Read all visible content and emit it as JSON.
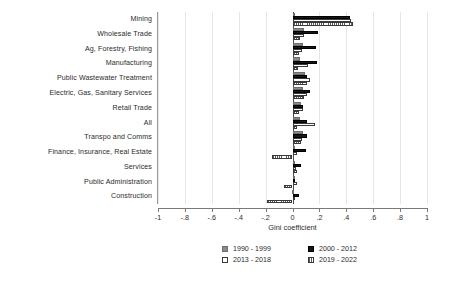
{
  "chart_data": {
    "type": "bar",
    "orientation": "horizontal",
    "title": "",
    "xlabel": "Gini coefficient",
    "ylabel": "",
    "xlim": [
      -1,
      1
    ],
    "grid": true,
    "legend_position": "bottom",
    "xticks": [
      -1,
      -0.8,
      -0.6,
      -0.4,
      -0.2,
      0,
      0.2,
      0.4,
      0.6,
      0.8,
      1
    ],
    "xticklabels": [
      "-1",
      "-.8",
      "-.6",
      "-.4",
      "-.2",
      "0",
      ".2",
      ".4",
      ".6",
      ".8",
      "1"
    ],
    "categories": [
      "Mining",
      "Wholesale Trade",
      "Ag, Forestry, Fishing",
      "Manufacturing",
      "Public Wastewater Treatment",
      "Electric, Gas, Sanitary Services",
      "Retail Trade",
      "All",
      "Transpo and Comms",
      "Finance, Insurance, Real Estate",
      "Services",
      "Public Administration",
      "Construction"
    ],
    "series": [
      {
        "name": "1990 - 1999",
        "color": "#8c8c8c",
        "pattern": "solid-gray",
        "values": [
          0.015,
          0.085,
          0.075,
          0.055,
          0.095,
          0.075,
          0.065,
          0.055,
          0.075,
          0.02,
          0.015,
          0.01,
          -0.005
        ]
      },
      {
        "name": "2000 - 2012",
        "color": "#151515",
        "pattern": "solid-black",
        "values": [
          0.43,
          0.19,
          0.175,
          0.18,
          0.11,
          0.13,
          0.08,
          0.105,
          0.105,
          0.1,
          0.065,
          0.02,
          0.045
        ]
      },
      {
        "name": "2013 - 2018",
        "color": "#ffffff",
        "pattern": "hollow",
        "values": [
          0.435,
          0.085,
          0.07,
          0.115,
          0.13,
          0.11,
          0.075,
          0.165,
          0.07,
          0.035,
          0.025,
          0.035,
          0.02
        ]
      },
      {
        "name": "2019 - 2022",
        "color": "#ffffff",
        "pattern": "hatched",
        "values": [
          0.45,
          0.055,
          0.045,
          0.04,
          0.105,
          0.085,
          0.05,
          0.03,
          0.06,
          -0.155,
          0.035,
          -0.06,
          -0.19
        ]
      }
    ]
  },
  "legend": {
    "items": [
      {
        "label": "1990 - 1999",
        "swatch": "gray-swatch"
      },
      {
        "label": "2000 - 2012",
        "swatch": "black-swatch"
      },
      {
        "label": "2013 - 2018",
        "swatch": "hollow-swatch"
      },
      {
        "label": "2019 - 2022",
        "swatch": "hatched-swatch"
      }
    ]
  }
}
